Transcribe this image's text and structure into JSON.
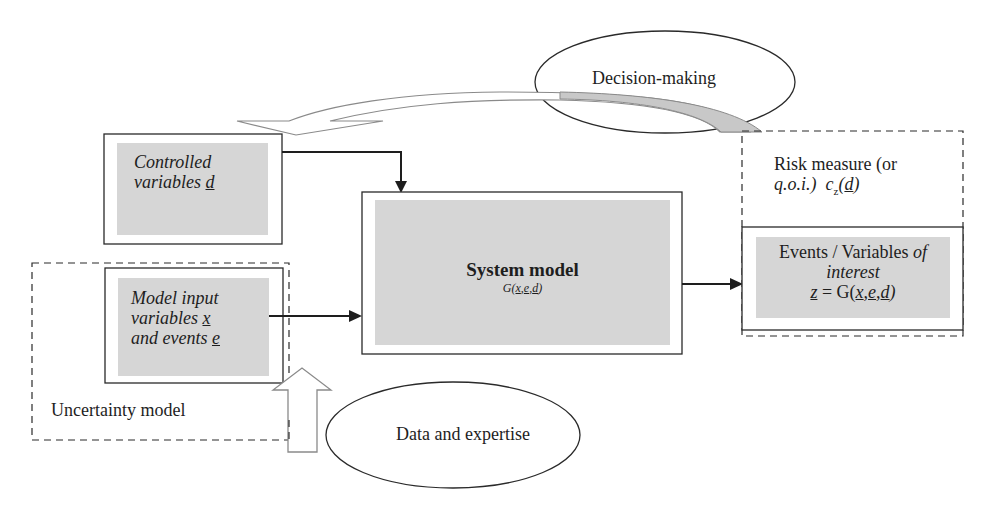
{
  "diagram": {
    "type": "flow",
    "nodes": {
      "decision": {
        "label": "Decision-making",
        "shape": "ellipse"
      },
      "controlled": {
        "line1": "Controlled",
        "line2_text": "variables ",
        "line2_var": "d",
        "shape": "box"
      },
      "system": {
        "title": "System model",
        "formula_prefix": "G(",
        "var_x": "x",
        "var_e": "e",
        "var_d": "d",
        "formula_suffix": ")",
        "sep": ","
      },
      "model_input": {
        "line1": "Model input",
        "line2_text": "variables ",
        "line2_var": "x",
        "line3_text": "and events ",
        "line3_var": "e"
      },
      "uncertainty": {
        "label": "Uncertainty model",
        "shape": "dashed-group"
      },
      "risk": {
        "line1": "Risk measure (or",
        "line2_qoi": "q.o.i.)",
        "line2_c": "c",
        "line2_sub": "z",
        "line2_open": "(",
        "line2_var": "d",
        "line2_close": ")"
      },
      "events": {
        "line1_text": "Events / Variables ",
        "line1_it": "of",
        "line2": "interest",
        "z_var": "z",
        "eq": " = G(",
        "x": "x",
        "e": "e",
        "d": "d",
        "comma": ",",
        "close": ")"
      },
      "data": {
        "label": "Data and expertise",
        "shape": "ellipse"
      }
    },
    "edges": [
      {
        "from": "controlled",
        "to": "system",
        "style": "solid-arrow"
      },
      {
        "from": "model_input",
        "to": "system",
        "style": "solid-arrow"
      },
      {
        "from": "system",
        "to": "events",
        "style": "solid-arrow"
      },
      {
        "from": "data",
        "to": "model_input",
        "style": "hollow-block-arrow"
      },
      {
        "from": "risk",
        "to": "controlled",
        "via": "decision",
        "style": "curved-hollow-arrow"
      }
    ],
    "colors": {
      "box_fill": "#d6d6d6",
      "stroke": "#2a2a2a",
      "hollow_arrow": "#8a8a8a",
      "curve_fill": "#c8c8c8"
    }
  }
}
